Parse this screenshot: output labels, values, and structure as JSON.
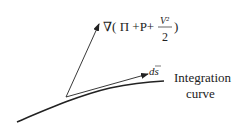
{
  "diagram": {
    "gradient_label": {
      "prefix": "∇( Π +P+",
      "fraction_numerator": "V²",
      "fraction_denominator": "2",
      "suffix": ")"
    },
    "ds_label": "ds",
    "curve_label_line1": "Integration",
    "curve_label_line2": "curve",
    "stroke_color": "#222222"
  }
}
